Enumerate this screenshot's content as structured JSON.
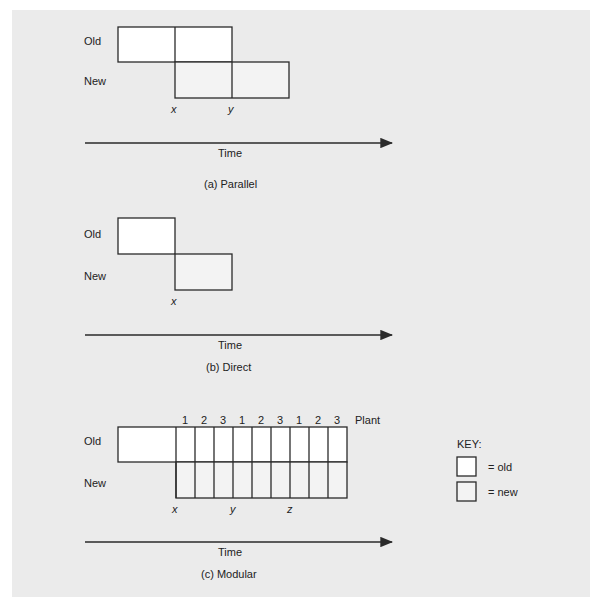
{
  "colors": {
    "panel_bg": "#ebebeb",
    "old_fill": "#ffffff",
    "new_fill": "#f3f3f3",
    "stroke": "#2a2a2a"
  },
  "row_labels": {
    "old": "Old",
    "new": "New"
  },
  "axis_label": "Time",
  "panels": [
    {
      "id": "parallel",
      "caption": "(a) Parallel",
      "markers": [
        "x",
        "y"
      ]
    },
    {
      "id": "direct",
      "caption": "(b) Direct",
      "markers": [
        "x"
      ]
    },
    {
      "id": "modular",
      "caption": "(c) Modular",
      "markers": [
        "x",
        "y",
        "z"
      ],
      "plant_numbers": [
        "1",
        "2",
        "3",
        "1",
        "2",
        "3",
        "1",
        "2",
        "3"
      ],
      "plant_label": "Plant"
    }
  ],
  "key": {
    "title": "KEY:",
    "items": [
      {
        "label": "= old",
        "fill": "#ffffff"
      },
      {
        "label": "= new",
        "fill": "#f3f3f3"
      }
    ]
  }
}
